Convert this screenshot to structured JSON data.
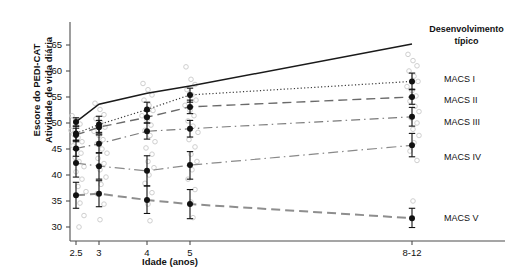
{
  "chart_data": {
    "type": "line",
    "title": "",
    "xlabel": "Idade (anos)",
    "ylabel_line1": "Escore do PEDI-CAT",
    "ylabel_line2": "Atividade de vida diária",
    "categories": [
      "2.5",
      "3",
      "4",
      "5",
      "8-12"
    ],
    "x_tick_labels": [
      "2.5",
      "3",
      "4",
      "5",
      "8-12"
    ],
    "x_positions_px": [
      76,
      99,
      147,
      190,
      412
    ],
    "y_tick_labels": [
      "30",
      "35",
      "40",
      "45",
      "50",
      "55",
      "60",
      "65"
    ],
    "y_tick_values": [
      30,
      35,
      40,
      45,
      50,
      55,
      60,
      65
    ],
    "ylim": [
      28,
      68
    ],
    "xlim_px": [
      70,
      505
    ],
    "grid": false,
    "legend_position": "right-inline",
    "marker": "filled-circle-with-error-bars",
    "scatter_marker": "open-circle-light-gray",
    "series": [
      {
        "name": "Desenvolvimento típico",
        "label": "Desenvolvimento típico",
        "label_line1": "Desenvolvimento",
        "label_line2": "típico",
        "linestyle": "solid",
        "color": "#1a1a1a",
        "points": [
          {
            "x": "2.5",
            "y": 50.2,
            "err_low": 49.4,
            "err_high": 51.0
          },
          {
            "x": "3",
            "y": 53.6,
            "err_low": 53.6,
            "err_high": 53.6
          },
          {
            "x": "4",
            "y": 55.7,
            "err_low": 55.7,
            "err_high": 55.7
          },
          {
            "x": "5",
            "y": 57.1,
            "err_low": 57.1,
            "err_high": 57.1
          },
          {
            "x": "8-12",
            "y": 65.2,
            "err_low": 65.2,
            "err_high": 65.2
          }
        ],
        "label_y_px": 24
      },
      {
        "name": "MACS I",
        "label": "MACS I",
        "linestyle": "dotted",
        "color": "#3a3a3a",
        "points": [
          {
            "x": "2.5",
            "y": 48.0,
            "err_low": 46.6,
            "err_high": 49.4
          },
          {
            "x": "3",
            "y": 49.7,
            "err_low": 48.2,
            "err_high": 51.3
          },
          {
            "x": "4",
            "y": 52.6,
            "err_low": 51.3,
            "err_high": 54.0
          },
          {
            "x": "5",
            "y": 55.4,
            "err_low": 54.0,
            "err_high": 56.7
          },
          {
            "x": "8-12",
            "y": 58.0,
            "err_low": 56.5,
            "err_high": 59.6
          }
        ],
        "label_y_px": 74
      },
      {
        "name": "MACS II",
        "label": "MACS II",
        "linestyle": "long-dash",
        "color": "#6a6a6a",
        "points": [
          {
            "x": "2.5",
            "y": 47.7,
            "err_low": 46.4,
            "err_high": 49.0
          },
          {
            "x": "3",
            "y": 49.2,
            "err_low": 47.9,
            "err_high": 50.5
          },
          {
            "x": "4",
            "y": 51.1,
            "err_low": 50.0,
            "err_high": 52.3
          },
          {
            "x": "5",
            "y": 53.1,
            "err_low": 51.8,
            "err_high": 54.4
          },
          {
            "x": "8-12",
            "y": 55.0,
            "err_low": 53.6,
            "err_high": 56.4
          }
        ],
        "label_y_px": 95
      },
      {
        "name": "MACS III",
        "label": "MACS III",
        "linestyle": "dash-dot",
        "color": "#7a7a7a",
        "points": [
          {
            "x": "2.5",
            "y": 45.1,
            "err_low": 43.6,
            "err_high": 46.7
          },
          {
            "x": "3",
            "y": 46.0,
            "err_low": 44.3,
            "err_high": 47.7
          },
          {
            "x": "4",
            "y": 48.4,
            "err_low": 46.9,
            "err_high": 50.0
          },
          {
            "x": "5",
            "y": 48.9,
            "err_low": 47.3,
            "err_high": 50.5
          },
          {
            "x": "8-12",
            "y": 51.2,
            "err_low": 49.4,
            "err_high": 53.0
          }
        ],
        "label_y_px": 117
      },
      {
        "name": "MACS IV",
        "label": "MACS IV",
        "linestyle": "dash-dot-long",
        "color": "#8a8a8a",
        "points": [
          {
            "x": "2.5",
            "y": 42.3,
            "err_low": 39.6,
            "err_high": 44.9
          },
          {
            "x": "3",
            "y": 41.7,
            "err_low": 39.2,
            "err_high": 44.2
          },
          {
            "x": "4",
            "y": 40.8,
            "err_low": 37.9,
            "err_high": 43.7
          },
          {
            "x": "5",
            "y": 41.9,
            "err_low": 39.2,
            "err_high": 44.5
          },
          {
            "x": "8-12",
            "y": 45.7,
            "err_low": 43.5,
            "err_high": 48.0
          }
        ],
        "label_y_px": 152
      },
      {
        "name": "MACS V",
        "label": "MACS V",
        "linestyle": "thick-dash",
        "color": "#8e8e8e",
        "points": [
          {
            "x": "2.5",
            "y": 36.1,
            "err_low": 33.6,
            "err_high": 38.6
          },
          {
            "x": "3",
            "y": 36.4,
            "err_low": 33.9,
            "err_high": 38.9
          },
          {
            "x": "4",
            "y": 35.2,
            "err_low": 32.6,
            "err_high": 37.9
          },
          {
            "x": "5",
            "y": 34.4,
            "err_low": 31.6,
            "err_high": 37.2
          },
          {
            "x": "8-12",
            "y": 31.7,
            "err_low": 29.9,
            "err_high": 33.6
          }
        ],
        "label_y_px": 213
      }
    ],
    "scatter_points": [
      {
        "x_px": 72,
        "y": 51.4
      },
      {
        "x_px": 76,
        "y": 50.6
      },
      {
        "x_px": 80,
        "y": 49.8
      },
      {
        "x_px": 71,
        "y": 48.6
      },
      {
        "x_px": 74,
        "y": 47.8
      },
      {
        "x_px": 78,
        "y": 47.2
      },
      {
        "x_px": 82,
        "y": 46.4
      },
      {
        "x_px": 73,
        "y": 45.6
      },
      {
        "x_px": 77,
        "y": 45.0
      },
      {
        "x_px": 81,
        "y": 44.2
      },
      {
        "x_px": 75,
        "y": 43.4
      },
      {
        "x_px": 79,
        "y": 42.6
      },
      {
        "x_px": 84,
        "y": 41.6
      },
      {
        "x_px": 76,
        "y": 40.6
      },
      {
        "x_px": 82,
        "y": 39.2
      },
      {
        "x_px": 78,
        "y": 37.8
      },
      {
        "x_px": 86,
        "y": 36.8
      },
      {
        "x_px": 80,
        "y": 34.6
      },
      {
        "x_px": 84,
        "y": 32.2
      },
      {
        "x_px": 79,
        "y": 30.0
      },
      {
        "x_px": 95,
        "y": 53.8
      },
      {
        "x_px": 100,
        "y": 52.6
      },
      {
        "x_px": 104,
        "y": 51.6
      },
      {
        "x_px": 96,
        "y": 50.8
      },
      {
        "x_px": 101,
        "y": 50.0
      },
      {
        "x_px": 105,
        "y": 49.2
      },
      {
        "x_px": 94,
        "y": 48.4
      },
      {
        "x_px": 99,
        "y": 47.6
      },
      {
        "x_px": 103,
        "y": 46.8
      },
      {
        "x_px": 97,
        "y": 46.0
      },
      {
        "x_px": 102,
        "y": 45.0
      },
      {
        "x_px": 107,
        "y": 44.2
      },
      {
        "x_px": 98,
        "y": 43.2
      },
      {
        "x_px": 104,
        "y": 42.2
      },
      {
        "x_px": 100,
        "y": 41.0
      },
      {
        "x_px": 106,
        "y": 39.6
      },
      {
        "x_px": 101,
        "y": 38.2
      },
      {
        "x_px": 97,
        "y": 36.4
      },
      {
        "x_px": 104,
        "y": 34.4
      },
      {
        "x_px": 100,
        "y": 31.4
      },
      {
        "x_px": 143,
        "y": 57.6
      },
      {
        "x_px": 148,
        "y": 56.4
      },
      {
        "x_px": 152,
        "y": 55.4
      },
      {
        "x_px": 144,
        "y": 54.4
      },
      {
        "x_px": 149,
        "y": 53.4
      },
      {
        "x_px": 153,
        "y": 52.4
      },
      {
        "x_px": 142,
        "y": 51.4
      },
      {
        "x_px": 147,
        "y": 50.6
      },
      {
        "x_px": 151,
        "y": 49.6
      },
      {
        "x_px": 145,
        "y": 48.6
      },
      {
        "x_px": 150,
        "y": 47.6
      },
      {
        "x_px": 155,
        "y": 46.4
      },
      {
        "x_px": 146,
        "y": 45.2
      },
      {
        "x_px": 152,
        "y": 44.0
      },
      {
        "x_px": 148,
        "y": 42.6
      },
      {
        "x_px": 154,
        "y": 41.4
      },
      {
        "x_px": 149,
        "y": 40.0
      },
      {
        "x_px": 145,
        "y": 38.4
      },
      {
        "x_px": 152,
        "y": 36.6
      },
      {
        "x_px": 148,
        "y": 34.4
      },
      {
        "x_px": 150,
        "y": 31.2
      },
      {
        "x_px": 186,
        "y": 60.8
      },
      {
        "x_px": 191,
        "y": 58.4
      },
      {
        "x_px": 195,
        "y": 57.4
      },
      {
        "x_px": 187,
        "y": 56.4
      },
      {
        "x_px": 192,
        "y": 55.4
      },
      {
        "x_px": 196,
        "y": 54.4
      },
      {
        "x_px": 185,
        "y": 53.4
      },
      {
        "x_px": 190,
        "y": 52.4
      },
      {
        "x_px": 194,
        "y": 51.4
      },
      {
        "x_px": 188,
        "y": 50.4
      },
      {
        "x_px": 193,
        "y": 49.4
      },
      {
        "x_px": 198,
        "y": 48.2
      },
      {
        "x_px": 189,
        "y": 46.8
      },
      {
        "x_px": 195,
        "y": 45.4
      },
      {
        "x_px": 191,
        "y": 44.0
      },
      {
        "x_px": 197,
        "y": 42.6
      },
      {
        "x_px": 192,
        "y": 41.0
      },
      {
        "x_px": 188,
        "y": 39.2
      },
      {
        "x_px": 195,
        "y": 37.2
      },
      {
        "x_px": 191,
        "y": 34.8
      },
      {
        "x_px": 193,
        "y": 31.8
      },
      {
        "x_px": 408,
        "y": 63.2
      },
      {
        "x_px": 413,
        "y": 62.0
      },
      {
        "x_px": 417,
        "y": 61.0
      },
      {
        "x_px": 409,
        "y": 60.0
      },
      {
        "x_px": 414,
        "y": 59.0
      },
      {
        "x_px": 418,
        "y": 58.0
      },
      {
        "x_px": 407,
        "y": 57.0
      },
      {
        "x_px": 412,
        "y": 56.2
      },
      {
        "x_px": 416,
        "y": 55.2
      },
      {
        "x_px": 410,
        "y": 54.2
      },
      {
        "x_px": 415,
        "y": 53.2
      },
      {
        "x_px": 419,
        "y": 52.2
      },
      {
        "x_px": 411,
        "y": 51.0
      },
      {
        "x_px": 417,
        "y": 50.0
      },
      {
        "x_px": 413,
        "y": 48.8
      },
      {
        "x_px": 419,
        "y": 47.6
      },
      {
        "x_px": 414,
        "y": 46.2
      },
      {
        "x_px": 410,
        "y": 44.6
      },
      {
        "x_px": 417,
        "y": 42.8
      },
      {
        "x_px": 413,
        "y": 35.0
      }
    ]
  },
  "colors": {
    "axis": "#4d4d4d",
    "typical": "#1a1a1a",
    "macs1": "#3a3a3a",
    "macs2": "#6a6a6a",
    "macs3": "#7a7a7a",
    "macs4": "#8a8a8a",
    "macs5": "#8e8e8e",
    "scatter": "#cfcfcf",
    "marker": "#111111"
  }
}
